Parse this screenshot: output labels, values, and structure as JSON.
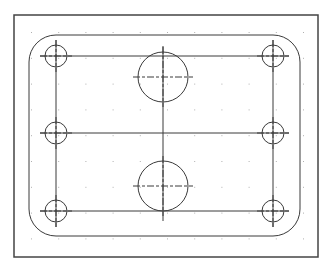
{
  "drawing": {
    "title": "",
    "colors": {
      "background": "#ffffff",
      "line": "#3a3a3a",
      "grid_dot": "#b0b0b0",
      "frame": "#444444"
    },
    "frame": {
      "x": 14,
      "y": 15,
      "w": 304,
      "h": 242
    },
    "outline": {
      "x": 29,
      "y": 35,
      "w": 271,
      "h": 201,
      "radius": 27
    },
    "inner_rect": {
      "x1": 56,
      "y1": 56,
      "x2": 273,
      "y2": 211
    },
    "center_lines": {
      "horizontal_mid_y": 133,
      "vertical_mid_x": 163
    },
    "small_holes": [
      {
        "cx": 56,
        "cy": 56,
        "r": 11
      },
      {
        "cx": 56,
        "cy": 133,
        "r": 11
      },
      {
        "cx": 56,
        "cy": 211,
        "r": 11
      },
      {
        "cx": 273,
        "cy": 56,
        "r": 11
      },
      {
        "cx": 273,
        "cy": 133,
        "r": 11
      },
      {
        "cx": 273,
        "cy": 211,
        "r": 11
      }
    ],
    "large_holes": [
      {
        "cx": 163,
        "cy": 77,
        "r": 25
      },
      {
        "cx": 163,
        "cy": 186,
        "r": 25
      }
    ],
    "grid": {
      "x0": 31,
      "y0": 32,
      "step_x": 27.2,
      "step_y": 25.8,
      "cols": 11,
      "rows": 9
    }
  }
}
